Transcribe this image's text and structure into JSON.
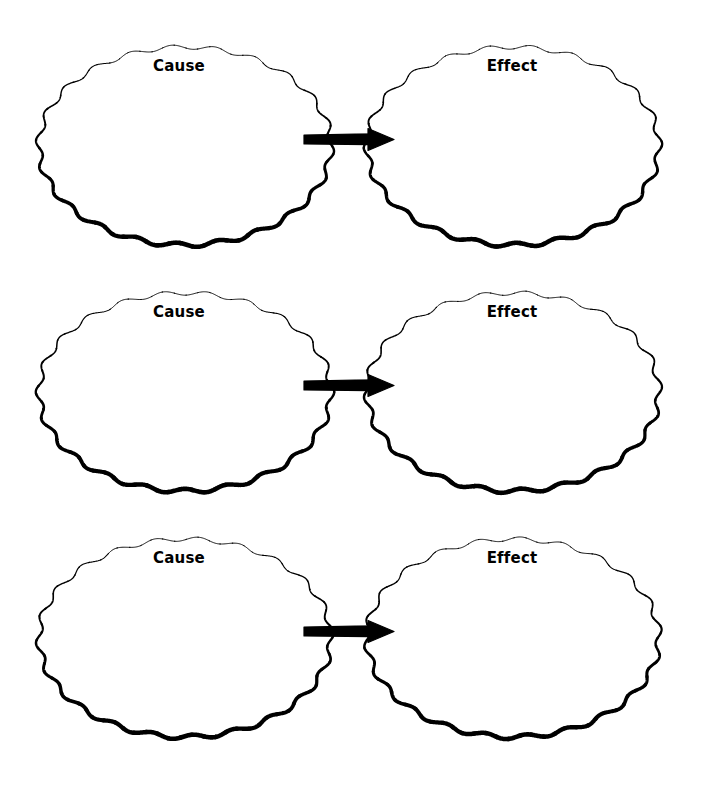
{
  "page": {
    "background_color": "#ffffff",
    "ink_color": "#000000",
    "width": 701,
    "height": 788
  },
  "labels": {
    "cause": "Cause",
    "effect": "Effect"
  },
  "icons": {
    "arrow": "right-arrow-icon",
    "bubble": "scalloped-ellipse-shape"
  },
  "rows": [
    {
      "index": 1,
      "cause_label": "Cause",
      "effect_label": "Effect",
      "arrow_direction": "right"
    },
    {
      "index": 2,
      "cause_label": "Cause",
      "effect_label": "Effect",
      "arrow_direction": "right"
    },
    {
      "index": 3,
      "cause_label": "Cause",
      "effect_label": "Effect",
      "arrow_direction": "right"
    }
  ]
}
